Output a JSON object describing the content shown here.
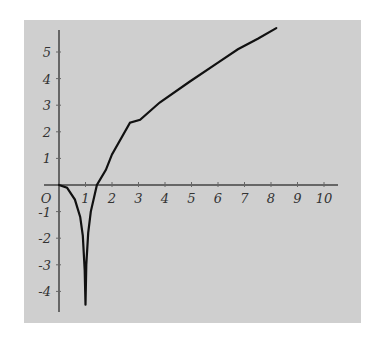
{
  "chart_data": {
    "type": "line",
    "title": "",
    "xlabel": "",
    "ylabel": "",
    "xlim": [
      0,
      10.5
    ],
    "ylim": [
      -4.7,
      5.8
    ],
    "grid": false,
    "legend": null,
    "x_ticks": [
      "O",
      "1",
      "2",
      "3",
      "4",
      "5",
      "6",
      "7",
      "8",
      "9",
      "10"
    ],
    "y_ticks": [
      "5",
      "4",
      "3",
      "2",
      "1",
      "-1",
      "-2",
      "-3",
      "-4"
    ],
    "annotations": [],
    "series": [
      {
        "name": "curve",
        "note": "Vertical asymptote at x = 1 (curve approaches -infinity from both sides)",
        "x": [
          0,
          0.3,
          0.6,
          0.8,
          0.9,
          0.97,
          1.03,
          1.1,
          1.2,
          1.43,
          1.77,
          2.0,
          2.68,
          3.06,
          3.8,
          4.94,
          6.0,
          6.75,
          7.5,
          8.2
        ],
        "y": [
          0,
          -0.1,
          -0.55,
          -1.2,
          -1.9,
          -3.2,
          -3.0,
          -1.8,
          -1.0,
          0,
          0.57,
          1.15,
          2.34,
          2.45,
          3.1,
          3.89,
          4.6,
          5.1,
          5.5,
          5.9
        ]
      }
    ],
    "colors": {
      "background": "#cfcfcf",
      "axis": "#666666",
      "curve": "#111111"
    }
  }
}
